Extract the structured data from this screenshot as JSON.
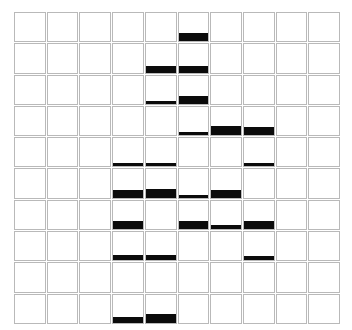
{
  "chart_data": {
    "type": "bar",
    "title": "",
    "subtitle": "",
    "xlabel": "",
    "ylabel": "",
    "grid": true,
    "legend": null,
    "layout": {
      "small_multiples": true,
      "rows": 10,
      "columns": 10,
      "panel_border_color": "#b9b9b9",
      "bar_color": "#0b0b0b",
      "background_color": "#ffffff",
      "bar_alignment": "bottom",
      "ylim": [
        0,
        1
      ]
    },
    "categories": [
      "C1",
      "C2",
      "C3",
      "C4",
      "C5",
      "C6",
      "C7",
      "C8",
      "C9",
      "C10"
    ],
    "row_labels": [
      "R1",
      "R2",
      "R3",
      "R4",
      "R5",
      "R6",
      "R7",
      "R8",
      "R9",
      "R10"
    ],
    "values": [
      [
        0,
        0,
        0,
        0,
        0,
        0.3,
        0,
        0,
        0,
        0
      ],
      [
        0,
        0,
        0,
        0,
        0.22,
        0.22,
        0,
        0,
        0,
        0
      ],
      [
        0,
        0,
        0,
        0,
        0.12,
        0.28,
        0,
        0,
        0,
        0
      ],
      [
        0,
        0,
        0,
        0,
        0,
        0.12,
        0.33,
        0.3,
        0,
        0
      ],
      [
        0,
        0,
        0,
        0.13,
        0.12,
        0,
        0,
        0.13,
        0,
        0
      ],
      [
        0,
        0,
        0,
        0.28,
        0.3,
        0.1,
        0.28,
        0,
        0,
        0
      ],
      [
        0,
        0,
        0,
        0.28,
        0,
        0.3,
        0.13,
        0.3,
        0,
        0
      ],
      [
        0,
        0,
        0,
        0.2,
        0.2,
        0,
        0,
        0.17,
        0,
        0
      ],
      [
        0,
        0,
        0,
        0,
        0,
        0,
        0,
        0,
        0,
        0
      ],
      [
        0,
        0,
        0,
        0.22,
        0.33,
        0,
        0,
        0,
        0,
        0
      ]
    ]
  }
}
